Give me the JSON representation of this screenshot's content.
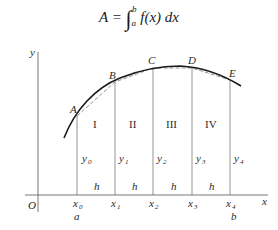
{
  "formula": {
    "lhs": "A",
    "equals": "=",
    "integral": "∫",
    "upper": "b",
    "lower": "a",
    "integrand": "f(x) dx"
  },
  "axes": {
    "x_label": "x",
    "y_label": "y",
    "origin_label": "O"
  },
  "points": [
    {
      "label": "A"
    },
    {
      "label": "B"
    },
    {
      "label": "C"
    },
    {
      "label": "D"
    },
    {
      "label": "E"
    }
  ],
  "regions": [
    {
      "label": "I"
    },
    {
      "label": "II"
    },
    {
      "label": "III"
    },
    {
      "label": "IV"
    }
  ],
  "ordinates": [
    {
      "base": "y",
      "sub": "0"
    },
    {
      "base": "y",
      "sub": "1"
    },
    {
      "base": "y",
      "sub": "2"
    },
    {
      "base": "y",
      "sub": "3"
    },
    {
      "base": "y",
      "sub": "4"
    }
  ],
  "abscissas": [
    {
      "base": "x",
      "sub": "0"
    },
    {
      "base": "x",
      "sub": "1"
    },
    {
      "base": "x",
      "sub": "2"
    },
    {
      "base": "x",
      "sub": "3"
    },
    {
      "base": "x",
      "sub": "4"
    }
  ],
  "width_label": "h",
  "bounds": {
    "a": "a",
    "b": "b"
  },
  "colors": {
    "line": "#1a1a1a",
    "thin": "#555555",
    "chord": "#777777"
  }
}
